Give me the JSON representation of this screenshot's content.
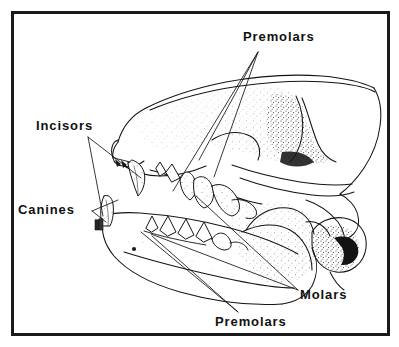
{
  "figure": {
    "name": "carnivore-skull-dentition-diagram",
    "background_color": "#ffffff",
    "ink_color": "#111111",
    "frame": {
      "name": "diagram-border",
      "x": 11,
      "y": 11,
      "width": 379,
      "height": 325,
      "stroke_width": 3,
      "color": "#1a1a1a"
    }
  },
  "labels": [
    {
      "id": "premolars-top",
      "text": "Premolars",
      "x": 243,
      "y": 41,
      "anchor": "start"
    },
    {
      "id": "incisors",
      "text": "Incisors",
      "x": 36,
      "y": 130,
      "anchor": "start"
    },
    {
      "id": "canines",
      "text": "Canines",
      "x": 18,
      "y": 214,
      "anchor": "start"
    },
    {
      "id": "molars",
      "text": "Molars",
      "x": 300,
      "y": 299,
      "anchor": "start"
    },
    {
      "id": "premolars-bottom",
      "text": "Premolars",
      "x": 215,
      "y": 326,
      "anchor": "start"
    }
  ],
  "leader_lines": {
    "premolars_top": [
      "M258,52 L173,191",
      "M258,52 L199,160",
      "M258,52 L214,177"
    ],
    "incisors": [
      "M88,137 L141,178",
      "M88,137 L103,216"
    ],
    "canines": [
      "M101,211 L118,203",
      "M101,211 L104,220"
    ],
    "molars": [
      "M298,290 L196,196",
      "M298,290 L151,234"
    ],
    "premolars_bottom": [
      "M238,312 L141,232",
      "M238,312 L152,236"
    ]
  },
  "anatomy_parts": [
    "cranium-outline",
    "nasal-bone",
    "zygomatic-arch",
    "sagittal-crest",
    "orbit",
    "auditory-bulla",
    "occipital-condyle",
    "mandible",
    "mental-foramen",
    "upper-incisors",
    "upper-canine",
    "upper-premolars",
    "upper-molars",
    "lower-canine",
    "lower-premolars",
    "lower-molars"
  ]
}
